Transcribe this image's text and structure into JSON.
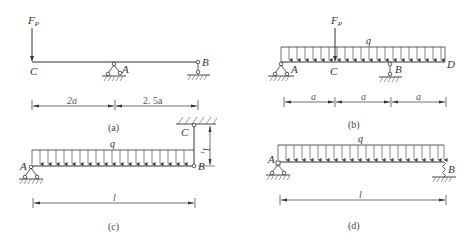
{
  "figures": [
    {
      "id": "a",
      "caption": "(a)",
      "force_label": "F",
      "force_sub": "P",
      "points": {
        "C": "C",
        "A": "A",
        "B": "B"
      },
      "dimensions": [
        "2a",
        "2. 5a"
      ]
    },
    {
      "id": "b",
      "caption": "(b)",
      "force_label": "F",
      "force_sub": "P",
      "load_label": "q",
      "points": {
        "A": "A",
        "C": "C",
        "B": "B",
        "D": "D"
      },
      "dimensions": [
        "a",
        "a",
        "a"
      ]
    },
    {
      "id": "c",
      "caption": "(c)",
      "load_label": "q",
      "points": {
        "A": "A",
        "B": "B",
        "C": "C"
      },
      "dimensions": [
        "l"
      ],
      "vertical_dimension": "l",
      "vertical_dimension_sub": "1"
    },
    {
      "id": "d",
      "caption": "(d)",
      "load_label": "q",
      "points": {
        "A": "A",
        "B": "B"
      },
      "dimensions": [
        "l"
      ]
    }
  ],
  "colors": {
    "line": "#333333",
    "text": "#333333",
    "background": "#ffffff"
  }
}
